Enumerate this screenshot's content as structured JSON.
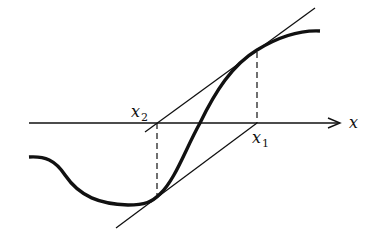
{
  "diagram": {
    "axis": {
      "label": "x",
      "y": 123,
      "x_start": 29,
      "x_end": 340
    },
    "labels": {
      "x1": {
        "base": "x",
        "sub": "1"
      },
      "x2": {
        "base": "x",
        "sub": "2"
      }
    },
    "points": {
      "x1": {
        "axis_x": 257,
        "curve_y": 50
      },
      "x2": {
        "axis_x": 157,
        "curve_y": 197
      }
    },
    "colors": {
      "stroke": "#111111",
      "background": "#ffffff"
    }
  }
}
